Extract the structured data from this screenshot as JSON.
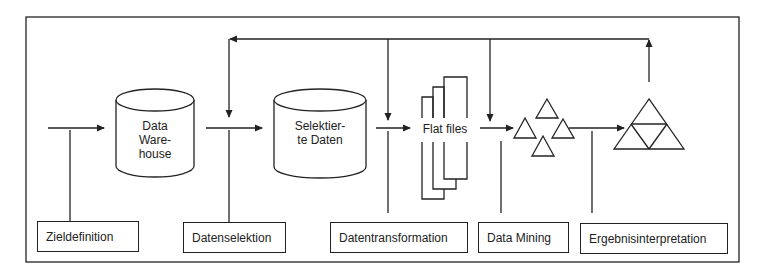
{
  "diagram": {
    "type": "process-flow",
    "stores": [
      {
        "id": "data-warehouse",
        "label_lines": [
          "Data",
          "Ware-",
          "house"
        ],
        "shape": "cylinder"
      },
      {
        "id": "selektierte-daten",
        "label_lines": [
          "Selektier-",
          "te Daten"
        ],
        "shape": "cylinder"
      },
      {
        "id": "flat-files",
        "label": "Flat files",
        "shape": "stacked-files"
      },
      {
        "id": "patterns",
        "shape": "triangle-cluster"
      },
      {
        "id": "knowledge",
        "shape": "triangle-pyramid"
      }
    ],
    "steps": [
      {
        "id": "zieldefinition",
        "label": "Zieldefinition"
      },
      {
        "id": "datenselektion",
        "label": "Datenselektion"
      },
      {
        "id": "datentransformation",
        "label": "Datentransformation"
      },
      {
        "id": "data-mining",
        "label": "Data Mining"
      },
      {
        "id": "ergebnisinterpretation",
        "label": "Ergebnisinterpretation"
      }
    ],
    "feedback_loop": "Ergebnisinterpretation returns to Datenselektion, Datentransformation and Data Mining",
    "colors": {
      "stroke": "#222222",
      "background": "#ffffff"
    }
  }
}
